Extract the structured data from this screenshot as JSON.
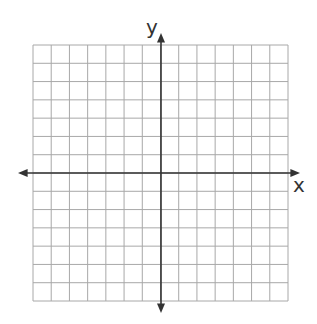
{
  "diagram": {
    "type": "coordinate-plane",
    "grid": {
      "columns": 14,
      "rows": 14,
      "left": 33,
      "top": 45,
      "right": 288,
      "bottom": 301,
      "color": "#a8a8a8"
    },
    "origin": {
      "x": 161,
      "y": 173
    },
    "axes": {
      "color": "#333333",
      "x": {
        "label": "x",
        "from": 18,
        "to": 300
      },
      "y": {
        "label": "y",
        "from": 33,
        "to": 313
      }
    }
  }
}
